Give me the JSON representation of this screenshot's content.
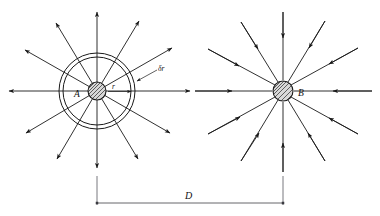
{
  "figure": {
    "type": "physics-field-line-diagram",
    "background_color": "#ffffff",
    "line_color": "#1a1a1a",
    "dimension_color": "#55555a",
    "sphere_fill": "#d8d8d8"
  },
  "labels": {
    "sphere_a": "A",
    "sphere_b": "B",
    "radius": "r",
    "shell_thickness": "δr",
    "separation": "D"
  },
  "geometry": {
    "sphere_a": {
      "cx": 97,
      "cy": 91,
      "radius": 9
    },
    "sphere_b": {
      "cx": 283,
      "cy": 91,
      "radius": 10
    },
    "shell_inner_radius": 34,
    "shell_outer_radius": 38,
    "separation_px": 186,
    "field_line_count": 12,
    "a_field_direction": "outward",
    "b_field_direction": "inward"
  },
  "dimension": {
    "label": "D",
    "left_x": 97,
    "right_x": 283,
    "baseline_y": 203,
    "extension_top_y": 176
  }
}
